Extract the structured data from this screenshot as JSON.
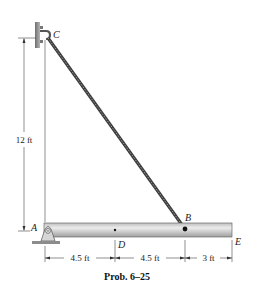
{
  "diagram": {
    "caption": "Prob. 6–25",
    "points": {
      "A": "A",
      "B": "B",
      "C": "C",
      "D": "D",
      "E": "E"
    },
    "dimensions": {
      "height_CA": "12 ft",
      "AD": "4.5 ft",
      "DB": "4.5 ft",
      "BE": "3 ft"
    },
    "colors": {
      "beam_light": "#e4e4e4",
      "beam_dark": "#9a9a9a",
      "cable": "#555555",
      "wall": "#8a8a8a",
      "line": "#333333"
    }
  }
}
